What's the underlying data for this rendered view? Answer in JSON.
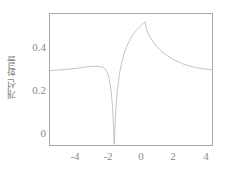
{
  "chart_data": {
    "type": "line",
    "title": "",
    "xlabel": "",
    "ylabel": "개선 확률",
    "xlim": [
      -5.0,
      5.0
    ],
    "ylim": [
      0.0,
      0.57
    ],
    "grid": false,
    "legend": null,
    "line_color": "#c8c4bc",
    "axis_color": "#a8a8a2",
    "tick_color": "#8a8a85",
    "xticks": [
      -4,
      -2,
      0,
      2,
      4
    ],
    "xticklabels": [
      "-4",
      "-2",
      "0",
      "2",
      "4"
    ],
    "yticks": [
      0,
      0.2,
      0.4
    ],
    "yticklabels": [
      "0",
      "0.2",
      "0.4"
    ],
    "annotations": [
      "left plateau near 0.32",
      "local bump near x=-2 at 0.34",
      "sharp minimum of 0 at x=-1",
      "cusp maximum of 0.53 at x=0.9",
      "right tail asymptote near 0.32"
    ],
    "series": [
      {
        "name": "개선 확률",
        "x": [
          -5.0,
          -4.8,
          -4.6,
          -4.4,
          -4.2,
          -4.0,
          -3.8,
          -3.6,
          -3.4,
          -3.2,
          -3.0,
          -2.8,
          -2.6,
          -2.4,
          -2.2,
          -2.0,
          -1.9,
          -1.8,
          -1.7,
          -1.6,
          -1.5,
          -1.45,
          -1.4,
          -1.35,
          -1.3,
          -1.25,
          -1.2,
          -1.15,
          -1.1,
          -1.05,
          -1.0,
          -0.97,
          -0.94,
          -0.9,
          -0.86,
          -0.8,
          -0.74,
          -0.68,
          -0.62,
          -0.56,
          -0.5,
          -0.44,
          -0.38,
          -0.32,
          -0.26,
          -0.2,
          -0.1,
          0.0,
          0.1,
          0.2,
          0.3,
          0.4,
          0.5,
          0.6,
          0.7,
          0.8,
          0.9,
          0.95,
          1.0,
          1.1,
          1.2,
          1.4,
          1.6,
          1.8,
          2.0,
          2.2,
          2.4,
          2.6,
          2.8,
          3.0,
          3.2,
          3.4,
          3.6,
          3.8,
          4.0,
          4.2,
          4.4,
          4.6,
          4.8,
          5.0
        ],
        "y": [
          0.321,
          0.322,
          0.323,
          0.324,
          0.325,
          0.326,
          0.327,
          0.329,
          0.33,
          0.332,
          0.334,
          0.336,
          0.338,
          0.339,
          0.34,
          0.34,
          0.339,
          0.338,
          0.335,
          0.331,
          0.323,
          0.317,
          0.309,
          0.298,
          0.283,
          0.263,
          0.237,
          0.203,
          0.16,
          0.097,
          0.003,
          0.05,
          0.098,
          0.15,
          0.19,
          0.238,
          0.275,
          0.304,
          0.328,
          0.348,
          0.366,
          0.382,
          0.396,
          0.409,
          0.42,
          0.431,
          0.446,
          0.459,
          0.471,
          0.481,
          0.49,
          0.498,
          0.506,
          0.513,
          0.52,
          0.526,
          0.532,
          0.508,
          0.496,
          0.479,
          0.466,
          0.444,
          0.427,
          0.412,
          0.399,
          0.388,
          0.379,
          0.37,
          0.363,
          0.357,
          0.351,
          0.346,
          0.342,
          0.338,
          0.335,
          0.332,
          0.33,
          0.328,
          0.326,
          0.325
        ]
      }
    ]
  },
  "axes": {
    "frame": {
      "left": 49,
      "top": 13,
      "right": 212,
      "bottom": 145
    }
  }
}
